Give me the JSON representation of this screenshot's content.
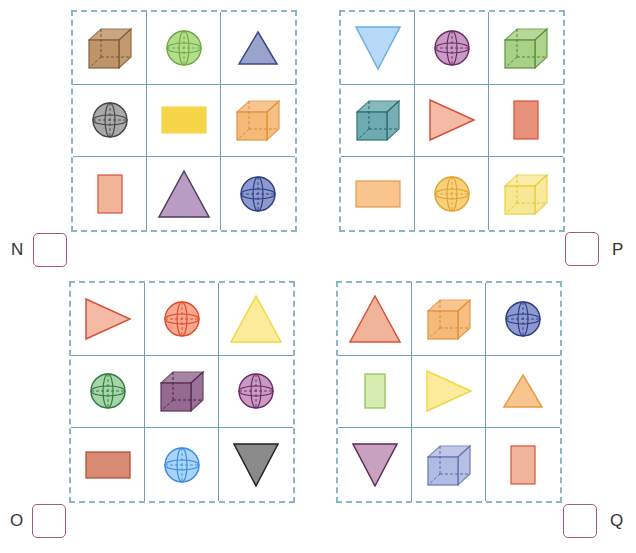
{
  "puzzles": [
    {
      "id": "N",
      "label": "N",
      "cells": [
        {
          "shape": "cube",
          "color": "#b8895a",
          "stroke": "#7a5228"
        },
        {
          "shape": "sphere",
          "color": "#b5dc8e",
          "stroke": "#6aaa3a"
        },
        {
          "shape": "triangle-up",
          "color": "#9aa3cc",
          "stroke": "#3c4a8c"
        },
        {
          "shape": "sphere",
          "color": "#a9a9a9",
          "stroke": "#444444"
        },
        {
          "shape": "rect-wide",
          "color": "#f7d54a",
          "stroke": "#f7d54a"
        },
        {
          "shape": "cube",
          "color": "#f5b36b",
          "stroke": "#e08a2c"
        },
        {
          "shape": "rect-tall",
          "color": "#f0b49a",
          "stroke": "#d9503a"
        },
        {
          "shape": "triangle-up-large",
          "color": "#b89cc4",
          "stroke": "#4e3d5e"
        },
        {
          "shape": "sphere",
          "color": "#8c9ad0",
          "stroke": "#2c3a80"
        }
      ]
    },
    {
      "id": "P",
      "label": "P",
      "cells": [
        {
          "shape": "triangle-down",
          "color": "#b6d9f7",
          "stroke": "#6aaee3"
        },
        {
          "shape": "sphere",
          "color": "#c89ac4",
          "stroke": "#6b2a62"
        },
        {
          "shape": "cube",
          "color": "#9fcc7a",
          "stroke": "#4c8a2c"
        },
        {
          "shape": "cube",
          "color": "#5fa3a8",
          "stroke": "#1f6268"
        },
        {
          "shape": "triangle-right",
          "color": "#f5baa6",
          "stroke": "#d9503a"
        },
        {
          "shape": "rect-tall",
          "color": "#e9907a",
          "stroke": "#d9503a"
        },
        {
          "shape": "rect-wide",
          "color": "#f8c58e",
          "stroke": "#e89a4a"
        },
        {
          "shape": "sphere",
          "color": "#f8d27a",
          "stroke": "#e0a030"
        },
        {
          "shape": "cube",
          "color": "#f7e68a",
          "stroke": "#e8cc2a"
        }
      ]
    },
    {
      "id": "O",
      "label": "O",
      "cells": [
        {
          "shape": "triangle-right",
          "color": "#f5baa6",
          "stroke": "#d9503a"
        },
        {
          "shape": "sphere",
          "color": "#f7a890",
          "stroke": "#e04828"
        },
        {
          "shape": "triangle-up-large",
          "color": "#fbeb9a",
          "stroke": "#f0d840"
        },
        {
          "shape": "sphere",
          "color": "#a6d4a6",
          "stroke": "#2c7a40"
        },
        {
          "shape": "cube",
          "color": "#8a5a86",
          "stroke": "#4a1e46"
        },
        {
          "shape": "sphere",
          "color": "#c89ac4",
          "stroke": "#6b2a62"
        },
        {
          "shape": "rect-wide",
          "color": "#d98a72",
          "stroke": "#b04a30"
        },
        {
          "shape": "sphere",
          "color": "#a8d4f7",
          "stroke": "#3a8ae0"
        },
        {
          "shape": "triangle-down",
          "color": "#8a8a8a",
          "stroke": "#222222"
        }
      ]
    },
    {
      "id": "Q",
      "label": "Q",
      "cells": [
        {
          "shape": "triangle-up-large",
          "color": "#f0b49a",
          "stroke": "#d9503a"
        },
        {
          "shape": "cube",
          "color": "#f5b36b",
          "stroke": "#e08a2c"
        },
        {
          "shape": "sphere",
          "color": "#8c9ad0",
          "stroke": "#2c3a80"
        },
        {
          "shape": "rect-tall-small",
          "color": "#d6ebb0",
          "stroke": "#8cc04a"
        },
        {
          "shape": "triangle-right",
          "color": "#fbeb9a",
          "stroke": "#f0d840"
        },
        {
          "shape": "triangle-up",
          "color": "#f8c58e",
          "stroke": "#e89a4a"
        },
        {
          "shape": "triangle-down",
          "color": "#c8a0c0",
          "stroke": "#5e2a52"
        },
        {
          "shape": "cube",
          "color": "#aab4e0",
          "stroke": "#5a6aa8"
        },
        {
          "shape": "rect-tall",
          "color": "#f0b49a",
          "stroke": "#d9503a"
        }
      ]
    }
  ]
}
